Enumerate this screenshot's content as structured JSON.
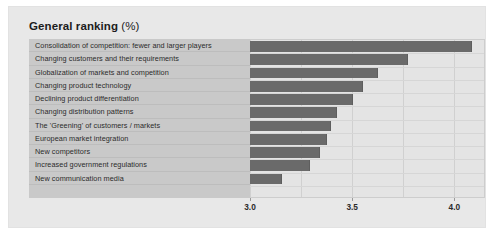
{
  "title": {
    "main": "General ranking",
    "suffix": "(%)"
  },
  "chart_data": {
    "type": "bar",
    "orientation": "horizontal",
    "title": "General ranking (%)",
    "xlabel": "",
    "ylabel": "",
    "xlim": [
      3.0,
      4.15
    ],
    "xticks": [
      3.0,
      3.5,
      4.0
    ],
    "xtick_labels": [
      "3.0",
      "3.5",
      "4.0"
    ],
    "gridlines": [
      3.0,
      3.25,
      3.5,
      3.75,
      4.0
    ],
    "grid": true,
    "legend": null,
    "bar_color": "#6a6a6a",
    "categories": [
      "Consolidation of competition: fewer and larger players",
      "Changing customers and their requirements",
      "Globalization of markets and competition",
      "Changing product technology",
      "Declining product differentiation",
      "Changing distribution patterns",
      "The 'Greening' of customers / markets",
      "European market integration",
      "New competitors",
      "Increased government regulations",
      "New communication media"
    ],
    "values": [
      4.08,
      3.77,
      3.62,
      3.55,
      3.5,
      3.42,
      3.39,
      3.37,
      3.34,
      3.29,
      3.15
    ]
  },
  "colors": {
    "panel_background": "#e8e8e8",
    "label_panel": "#c9c9c9",
    "plot_background": "#e4e4e4",
    "bar": "#6a6a6a",
    "gridline": "#d0d0d0",
    "text": "#2b2b2b"
  }
}
